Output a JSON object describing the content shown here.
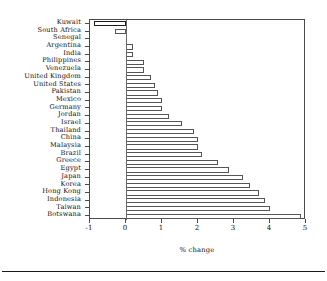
{
  "chart_data": {
    "type": "bar",
    "orientation": "horizontal",
    "title": "",
    "xlabel": "% change",
    "ylabel": "",
    "xlim": [
      -1,
      5
    ],
    "xticks": [
      -1,
      0,
      1,
      2,
      3,
      4,
      5
    ],
    "xticklabels": [
      "-1",
      "0",
      "1",
      "2",
      "3",
      "4",
      "5"
    ],
    "grid": false,
    "legend": null,
    "categories": [
      "Kuwait",
      "South Africa",
      "Senegal",
      "Argentina",
      "India",
      "Philippines",
      "Venezuela",
      "United Kingdom",
      "United States",
      "Pakistan",
      "Mexico",
      "Germany",
      "Jordan",
      "Israel",
      "Thailand",
      "China",
      "Malaysia",
      "Brazil",
      "Greece",
      "Egypt",
      "Japan",
      "Korea",
      "Hong Kong",
      "Indonesia",
      "Taiwan",
      "Botswana"
    ],
    "values": [
      -0.9,
      -0.3,
      0.0,
      0.2,
      0.2,
      0.5,
      0.5,
      0.7,
      0.8,
      0.9,
      1.0,
      1.0,
      1.2,
      1.55,
      1.9,
      2.0,
      2.0,
      2.1,
      2.55,
      2.85,
      3.25,
      3.45,
      3.7,
      3.85,
      4.0,
      4.85
    ],
    "colors": {
      "bar_fill": "#ffffff",
      "bar_edge": "#555555",
      "axis": "#4a4a4a",
      "text": "#111111"
    }
  }
}
